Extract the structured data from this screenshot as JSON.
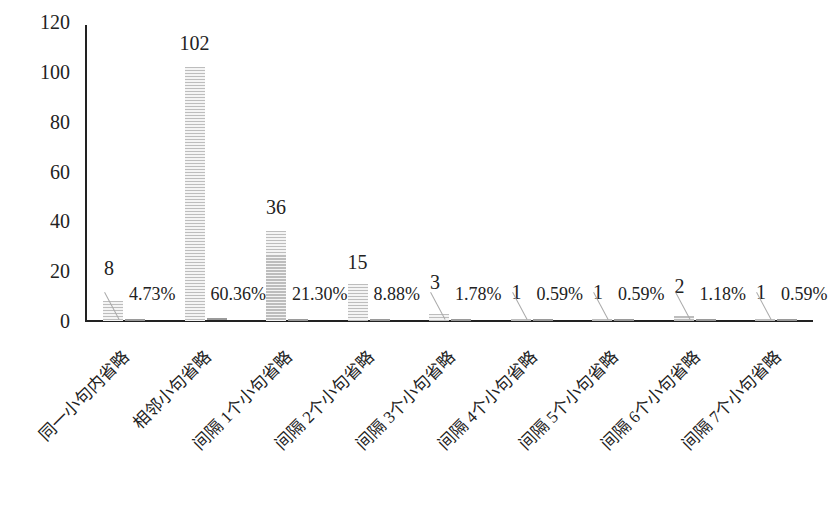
{
  "chart_data": {
    "type": "bar",
    "title": "",
    "xlabel": "",
    "ylabel": "",
    "ylim": [
      0,
      120
    ],
    "yticks": [
      0,
      20,
      40,
      60,
      80,
      100,
      120
    ],
    "grid": false,
    "legend": null,
    "categories": [
      "同一小句内省略",
      "相邻小句省略",
      "间隔 1个小句省略",
      "间隔 2个小句省略",
      "间隔 3个小句省略",
      "间隔 4个小句省略",
      "间隔 5个小句省略",
      "间隔 6个小句省略",
      "间隔 7个小句省略"
    ],
    "series": [
      {
        "name": "频次",
        "values": [
          8,
          102,
          36,
          15,
          3,
          1,
          1,
          2,
          1
        ]
      },
      {
        "name": "比例",
        "values": [
          4.73,
          60.36,
          21.3,
          8.88,
          1.78,
          0.59,
          0.59,
          1.18,
          0.59
        ],
        "labels": [
          "4.73%",
          "60.36%",
          "21.30%",
          "8.88%",
          "1.78%",
          "0.59%",
          "0.59%",
          "1.18%",
          "0.59%"
        ]
      }
    ],
    "value_labels": [
      "8",
      "102",
      "36",
      "15",
      "3",
      "1",
      "1",
      "2",
      "1"
    ]
  }
}
